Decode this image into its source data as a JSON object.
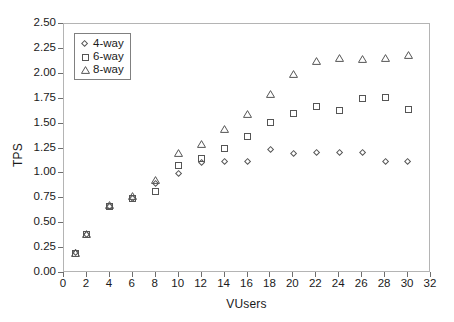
{
  "chart_data": {
    "type": "scatter",
    "title": "",
    "xlabel": "VUsers",
    "ylabel": "TPS",
    "xlim": [
      0,
      32
    ],
    "ylim": [
      0,
      2.5
    ],
    "xticks": [
      0,
      2,
      4,
      6,
      8,
      10,
      12,
      14,
      16,
      18,
      20,
      22,
      24,
      26,
      28,
      30,
      32
    ],
    "xtick_labels": [
      "0",
      "2",
      "4",
      "6",
      "8",
      "10",
      "12",
      "14",
      "16",
      "18",
      "20",
      "22",
      "24",
      "26",
      "28",
      "30",
      "32"
    ],
    "yticks": [
      0.0,
      0.25,
      0.5,
      0.75,
      1.0,
      1.25,
      1.5,
      1.75,
      2.0,
      2.25,
      2.5
    ],
    "ytick_labels": [
      "0.00",
      "0.25",
      "0.50",
      "0.75",
      "1.00",
      "1.25",
      "1.50",
      "1.75",
      "2.00",
      "2.25",
      "2.50"
    ],
    "grid": false,
    "legend_position": "upper left",
    "x": [
      1,
      2,
      4,
      6,
      8,
      10,
      12,
      14,
      16,
      18,
      20,
      22,
      24,
      26,
      28,
      30
    ],
    "series": [
      {
        "name": "4-way",
        "marker": "diamond",
        "color": "#555555",
        "values": [
          0.2,
          0.39,
          0.67,
          0.75,
          0.9,
          1.0,
          1.11,
          1.12,
          1.12,
          1.24,
          1.2,
          1.21,
          1.21,
          1.21,
          1.12,
          1.12
        ]
      },
      {
        "name": "6-way",
        "marker": "square",
        "color": "#555555",
        "values": [
          0.2,
          0.39,
          0.67,
          0.75,
          0.82,
          1.08,
          1.15,
          1.25,
          1.37,
          1.51,
          1.6,
          1.67,
          1.63,
          1.75,
          1.76,
          1.64
        ]
      },
      {
        "name": "8-way",
        "marker": "triangle",
        "color": "#555555",
        "values": [
          0.2,
          0.39,
          0.68,
          0.77,
          0.93,
          1.2,
          1.3,
          1.45,
          1.6,
          1.8,
          2.0,
          2.13,
          2.16,
          2.15,
          2.16,
          2.19
        ]
      }
    ]
  },
  "legend": {
    "items": [
      {
        "label": "4-way",
        "marker": "diamond"
      },
      {
        "label": "6-way",
        "marker": "square"
      },
      {
        "label": "8-way",
        "marker": "triangle"
      }
    ]
  }
}
